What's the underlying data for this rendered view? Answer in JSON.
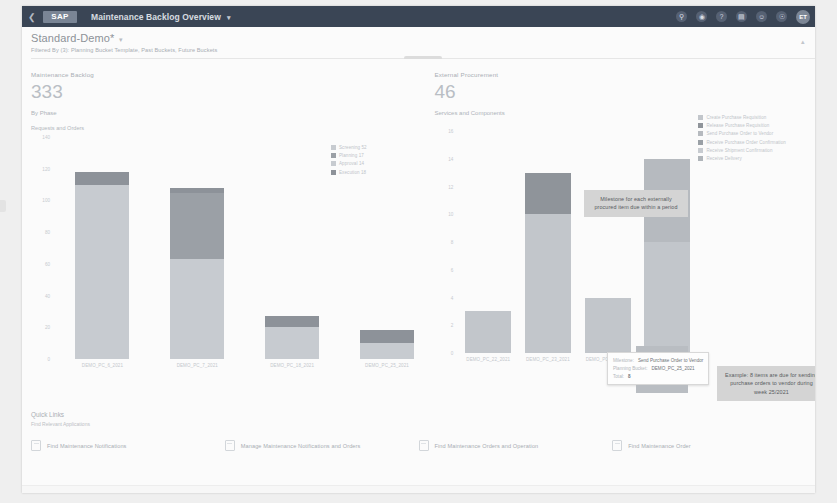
{
  "shell": {
    "back_icon": "chevron-left-icon",
    "logo_text": "SAP",
    "title": "Maintenance Backlog Overview",
    "title_caret": "▾",
    "icons": [
      "search-icon",
      "compass-icon",
      "help-icon",
      "notes-icon",
      "feedback-icon",
      "bell-icon"
    ],
    "avatar_initials": "ET"
  },
  "header": {
    "variant_title": "Standard-Demo*",
    "variant_caret": "▾",
    "filtered_by": "Filtered By (3): Planning Bucket Template, Past Buckets, Future Buckets",
    "collapse_icon": "collapse-icon"
  },
  "cards": {
    "left": {
      "kpi_label": "Maintenance Backlog",
      "kpi_value": "333",
      "kpi_sub": "By Phase",
      "kpi_sub2": "Requests and Orders"
    },
    "right": {
      "kpi_label": "External Procurement",
      "kpi_value": "46",
      "kpi_sub": "Services and Components"
    }
  },
  "chart_data": [
    {
      "type": "bar",
      "id": "maintenance-backlog-by-phase",
      "title": "Maintenance Backlog",
      "subtitle": "By Phase",
      "stacked": true,
      "grid": false,
      "legend_position": "right",
      "xlabel": "",
      "ylabel": "",
      "ylim": [
        0,
        140
      ],
      "yticks": [
        "140",
        "120",
        "100",
        "80",
        "60",
        "40",
        "20",
        "0"
      ],
      "categories": [
        "DEMO_PC_6_2021",
        "DEMO_PC_7_2021",
        "DEMO_PC_18_2021",
        "DEMO_PC_25_2021"
      ],
      "series": [
        {
          "name": "Screening",
          "count": "52",
          "color": "#c7cbd0",
          "values": [
            72,
            63,
            20,
            0
          ]
        },
        {
          "name": "Planning",
          "count": "17",
          "color": "#9ba0a6",
          "values": [
            0,
            42,
            0,
            0
          ]
        },
        {
          "name": "Approval",
          "count": "14",
          "color": "#c7cbd0",
          "values": [
            38,
            0,
            0,
            10
          ]
        },
        {
          "name": "Execution",
          "count": "18",
          "color": "#8d9299",
          "values": [
            8,
            3,
            7,
            8
          ]
        }
      ]
    },
    {
      "type": "bar",
      "id": "external-procurement-services-components",
      "title": "External Procurement",
      "subtitle": "Services and Components",
      "stacked": true,
      "grid": false,
      "legend_position": "right",
      "xlabel": "",
      "ylabel": "",
      "ylim": [
        0,
        16
      ],
      "yticks": [
        "16",
        "14",
        "12",
        "10",
        "8",
        "6",
        "4",
        "2",
        "0"
      ],
      "categories": [
        "DEMO_PC_22_2021",
        "DEMO_PC_23_2021",
        "DEMO_PC_24_2021",
        "DEMO_PC_25_2021"
      ],
      "series": [
        {
          "name": "Create Purchase Requisition",
          "color": "#c2c6cb",
          "values": [
            3,
            10,
            4,
            8
          ]
        },
        {
          "name": "Release Purchase Requisition",
          "color": "#8f949a",
          "values": [
            0,
            3,
            0,
            0
          ]
        },
        {
          "name": "Send Purchase Order to Vendor",
          "color": "#b6babf",
          "values": [
            0,
            0,
            0,
            6
          ]
        },
        {
          "name": "Receive Purchase Order Confirmation",
          "color": "#9aa0a6",
          "values": [
            0,
            0,
            0,
            0
          ]
        },
        {
          "name": "Receive Shipment Confirmation",
          "color": "#c7cbd0",
          "values": [
            0,
            0,
            0,
            0
          ]
        },
        {
          "name": "Receive Delivery",
          "color": "#b0b5ba",
          "values": [
            0,
            0,
            0,
            0
          ]
        }
      ]
    }
  ],
  "annotations": {
    "milestone_callout": "Milestone for each externally procured item due within a period",
    "example_callout": "Example: 8 items are due for sending purchase orders to vendor during week 25/2021"
  },
  "tooltip": {
    "milestone_key": "Milestone:",
    "milestone_value": "Send Purchase Order to Vendor",
    "bucket_key": "Planning Bucket:",
    "bucket_value": "DEMO_PC_25_2021",
    "total_key": "Total:",
    "total_value": "8"
  },
  "quick_links": {
    "title": "Quick Links",
    "subtitle": "Find Relevant Applications",
    "items": [
      {
        "label": "Find Maintenance Notifications",
        "icon": "app-tile-icon"
      },
      {
        "label": "Manage Maintenance Notifications and Orders",
        "icon": "app-tile-icon"
      },
      {
        "label": "Find Maintenance Orders and Operation",
        "icon": "app-tile-icon"
      },
      {
        "label": "Find Maintenance Order",
        "icon": "app-tile-icon"
      }
    ]
  }
}
